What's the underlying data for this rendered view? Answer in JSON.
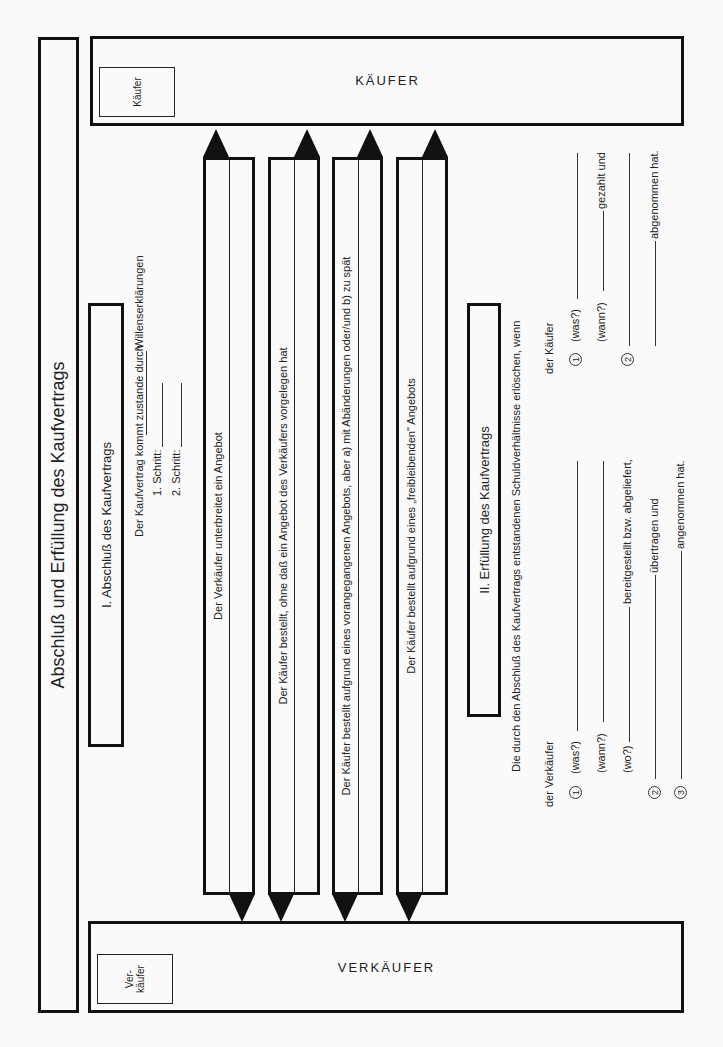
{
  "title": "Abschluß und Erfüllung des Kaufvertrags",
  "parties": {
    "buyer": {
      "small_label": "Käufer",
      "band_label": "KÄUFER"
    },
    "seller": {
      "small_label_line1": "Ver-",
      "small_label_line2": "käufer",
      "band_label": "VERKÄUFER"
    }
  },
  "section1": {
    "heading": "I. Abschluß des Kaufvertrags",
    "intro_prefix": "Der Kaufvertrag kommt zustande durch",
    "intro_suffix": "Willenserklärungen",
    "step1": "1. Schritt:",
    "step2": "2. Schritt:"
  },
  "arrows": [
    {
      "text": "Der Verkäufer unterbreitet ein Angebot",
      "head_to_buyer": "left",
      "head_to_seller": "right"
    },
    {
      "text": "Der Käufer bestellt, ohne daß ein Angebot des Verkäufers vorgelegen hat",
      "head_to_buyer": "right",
      "head_to_seller": "left"
    },
    {
      "text": "Der Käufer bestellt aufgrund eines vorangegangenen Angebots, aber a) mit Abänderungen oder/und b) zu spät",
      "head_to_buyer": "right",
      "head_to_seller": "left"
    },
    {
      "text": "Der Käufer bestellt aufgrund eines „freibleibenden\" Angebots",
      "head_to_buyer": "right",
      "head_to_seller": "left"
    }
  ],
  "section2": {
    "heading": "II. Erfüllung des Kaufvertrags",
    "intro": "Die durch den Abschluß des Kaufvertrags entstandenen Schuldverhältnisse erlöschen, wenn",
    "seller": {
      "label": "der Verkäufer",
      "items": [
        {
          "num": "1",
          "prompt": "(was?)"
        },
        {
          "num": "",
          "prompt": "(wann?)"
        },
        {
          "num": "",
          "prompt": "(wo?)",
          "suffix": "bereitgestellt bzw. abgeliefert,"
        },
        {
          "num": "2",
          "prompt": "",
          "suffix": "übertragen und"
        },
        {
          "num": "3",
          "prompt": "",
          "suffix": "angenommen hat."
        }
      ]
    },
    "buyer": {
      "label": "der Käufer",
      "items": [
        {
          "num": "1",
          "prompt": "(was?)"
        },
        {
          "num": "",
          "prompt": "(wann?)",
          "suffix": "gezahlt und"
        },
        {
          "num": "2",
          "prompt": ""
        },
        {
          "num": "",
          "prompt": "",
          "suffix": "abgenommen hat."
        }
      ]
    }
  }
}
